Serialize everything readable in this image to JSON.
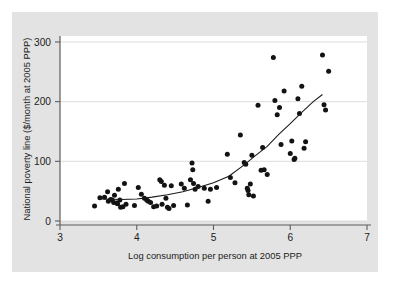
{
  "figure": {
    "background_color": "#e3e3e3",
    "panel_color": "#ffffff",
    "point_color": "#131313",
    "line_color": "#1a1a1a",
    "grid_color": "#d8d8d8",
    "axis_color": "#5d5d5d"
  },
  "chart_data": {
    "type": "scatter",
    "title": "",
    "subtitle": "",
    "xlabel": "Log consumption per person at 2005 PPP",
    "ylabel": "National poverty line ($/month at 2005 PPP)",
    "xlim": [
      3,
      7
    ],
    "ylim": [
      0,
      310
    ],
    "xticks": [
      3,
      4,
      5,
      6,
      7
    ],
    "xtick_labels": [
      "3",
      "4",
      "5",
      "6",
      "7"
    ],
    "yticks": [
      0,
      100,
      200,
      300
    ],
    "ytick_labels": [
      "0",
      "100",
      "200",
      "300"
    ],
    "grid": "horizontal",
    "legend": "none",
    "annotations": [],
    "series": [
      {
        "name": "Countries",
        "marker": "filled-circle",
        "points": [
          [
            3.45,
            25
          ],
          [
            3.52,
            39
          ],
          [
            3.58,
            40
          ],
          [
            3.62,
            49
          ],
          [
            3.63,
            33
          ],
          [
            3.66,
            36
          ],
          [
            3.68,
            35
          ],
          [
            3.7,
            31
          ],
          [
            3.71,
            43
          ],
          [
            3.74,
            30
          ],
          [
            3.75,
            29
          ],
          [
            3.76,
            53
          ],
          [
            3.78,
            35
          ],
          [
            3.79,
            23
          ],
          [
            3.82,
            24
          ],
          [
            3.84,
            63
          ],
          [
            3.86,
            28
          ],
          [
            3.97,
            26
          ],
          [
            4.02,
            56
          ],
          [
            4.06,
            45
          ],
          [
            4.1,
            38
          ],
          [
            4.13,
            35
          ],
          [
            4.15,
            33
          ],
          [
            4.18,
            31
          ],
          [
            4.22,
            24
          ],
          [
            4.26,
            25
          ],
          [
            4.3,
            69
          ],
          [
            4.32,
            66
          ],
          [
            4.33,
            28
          ],
          [
            4.36,
            60
          ],
          [
            4.38,
            38
          ],
          [
            4.4,
            23
          ],
          [
            4.42,
            21
          ],
          [
            4.45,
            59
          ],
          [
            4.48,
            26
          ],
          [
            4.58,
            62
          ],
          [
            4.62,
            55
          ],
          [
            4.66,
            27
          ],
          [
            4.7,
            69
          ],
          [
            4.72,
            97
          ],
          [
            4.73,
            86
          ],
          [
            4.74,
            63
          ],
          [
            4.76,
            53
          ],
          [
            4.8,
            58
          ],
          [
            4.88,
            55
          ],
          [
            4.93,
            33
          ],
          [
            4.96,
            53
          ],
          [
            5.04,
            56
          ],
          [
            5.18,
            112
          ],
          [
            5.22,
            73
          ],
          [
            5.28,
            64
          ],
          [
            5.35,
            144
          ],
          [
            5.4,
            98
          ],
          [
            5.42,
            95
          ],
          [
            5.44,
            55
          ],
          [
            5.45,
            51
          ],
          [
            5.46,
            44
          ],
          [
            5.48,
            62
          ],
          [
            5.5,
            110
          ],
          [
            5.52,
            42
          ],
          [
            5.58,
            194
          ],
          [
            5.62,
            85
          ],
          [
            5.64,
            123
          ],
          [
            5.66,
            86
          ],
          [
            5.7,
            78
          ],
          [
            5.78,
            274
          ],
          [
            5.8,
            202
          ],
          [
            5.83,
            178
          ],
          [
            5.86,
            190
          ],
          [
            5.88,
            128
          ],
          [
            5.92,
            218
          ],
          [
            6.0,
            113
          ],
          [
            6.02,
            134
          ],
          [
            6.05,
            103
          ],
          [
            6.06,
            105
          ],
          [
            6.1,
            205
          ],
          [
            6.12,
            180
          ],
          [
            6.15,
            226
          ],
          [
            6.18,
            122
          ],
          [
            6.2,
            133
          ],
          [
            6.42,
            278
          ],
          [
            6.44,
            195
          ],
          [
            6.46,
            186
          ],
          [
            6.5,
            251
          ]
        ]
      }
    ],
    "fit_line": {
      "name": "Nonparametric fit",
      "points": [
        [
          3.55,
          37
        ],
        [
          3.8,
          36
        ],
        [
          4.0,
          37
        ],
        [
          4.2,
          40
        ],
        [
          4.4,
          44
        ],
        [
          4.6,
          49
        ],
        [
          4.8,
          56
        ],
        [
          5.0,
          64
        ],
        [
          5.2,
          75
        ],
        [
          5.4,
          94
        ],
        [
          5.55,
          110
        ],
        [
          5.7,
          125
        ],
        [
          5.85,
          145
        ],
        [
          6.0,
          163
        ],
        [
          6.15,
          182
        ],
        [
          6.3,
          200
        ],
        [
          6.42,
          212
        ]
      ]
    }
  }
}
